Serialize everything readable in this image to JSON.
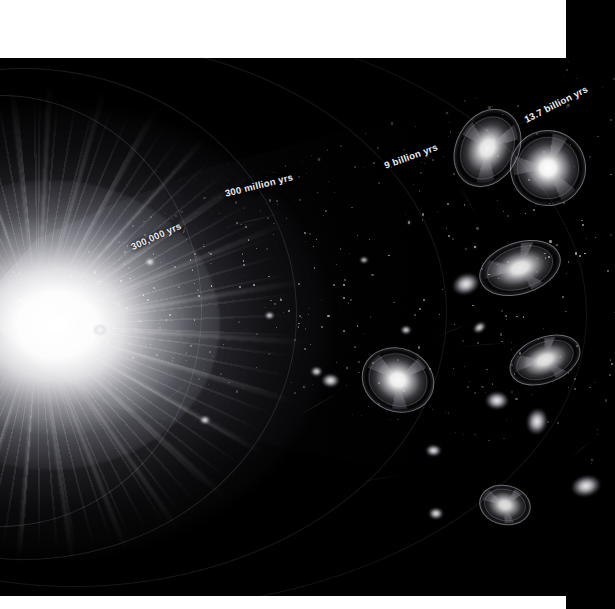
{
  "figure": {
    "background_color": "#000000",
    "letterbox_color": "#ffffff",
    "label_color": "#ededf2",
    "arc_color": "#afafbe"
  },
  "epoch_labels": [
    {
      "id": "epoch-300000-yrs",
      "text": "300,000 yrs",
      "x": 156,
      "y": 236,
      "rotation": -24
    },
    {
      "id": "epoch-300-million-yrs",
      "text": "300 million yrs",
      "x": 259,
      "y": 185,
      "rotation": -14
    },
    {
      "id": "epoch-9-billion-yrs",
      "text": "9 billion yrs",
      "x": 411,
      "y": 156,
      "rotation": -20
    },
    {
      "id": "epoch-13-7-billion-yrs",
      "text": "13.7 billion yrs",
      "x": 556,
      "y": 104,
      "rotation": -27
    }
  ],
  "epoch_arcs": [
    {
      "id": "arc-300000-yrs",
      "left": -200,
      "top": 95,
      "width": 400,
      "height": 430,
      "border_width": 1.1,
      "opacity": 0.46
    },
    {
      "id": "arc-300-million-yrs",
      "left": -250,
      "top": 68,
      "width": 545,
      "height": 490,
      "border_width": 1.0,
      "opacity": 0.4
    },
    {
      "id": "arc-9-billion-yrs",
      "left": -300,
      "top": 40,
      "width": 745,
      "height": 545,
      "border_width": 0.9,
      "opacity": 0.32
    },
    {
      "id": "arc-13-7-billion-yrs",
      "left": -340,
      "top": 18,
      "width": 925,
      "height": 590,
      "border_width": 0.9,
      "opacity": 0.28
    }
  ],
  "spiral_galaxies": [
    {
      "id": "galaxy-upper-left-oval",
      "x": 487,
      "y": 148,
      "w": 53,
      "h": 68,
      "rot": 28,
      "core": 0.95
    },
    {
      "id": "galaxy-upper-right-face",
      "x": 548,
      "y": 168,
      "w": 64,
      "h": 64,
      "rot": -12,
      "core": 1.0
    },
    {
      "id": "galaxy-mid-right-tilted",
      "x": 520,
      "y": 268,
      "w": 70,
      "h": 44,
      "rot": -18,
      "core": 0.92
    },
    {
      "id": "galaxy-lower-left-spiral",
      "x": 398,
      "y": 380,
      "w": 62,
      "h": 54,
      "rot": 22,
      "core": 0.98
    },
    {
      "id": "galaxy-lower-right-edge",
      "x": 545,
      "y": 360,
      "w": 62,
      "h": 38,
      "rot": -22,
      "core": 0.9
    },
    {
      "id": "galaxy-bottom-oval",
      "x": 505,
      "y": 505,
      "w": 44,
      "h": 34,
      "rot": 12,
      "core": 0.88
    }
  ],
  "blob_galaxies": [
    {
      "id": "blob-a",
      "x": 466,
      "y": 284,
      "w": 26,
      "h": 20,
      "rot": -20
    },
    {
      "id": "blob-b",
      "x": 497,
      "y": 400,
      "w": 22,
      "h": 17,
      "rot": 0
    },
    {
      "id": "blob-c",
      "x": 537,
      "y": 421,
      "w": 20,
      "h": 25,
      "rot": 10
    },
    {
      "id": "blob-d",
      "x": 586,
      "y": 486,
      "w": 28,
      "h": 20,
      "rot": -12
    },
    {
      "id": "blob-e",
      "x": 433,
      "y": 450,
      "w": 15,
      "h": 11,
      "rot": 0
    },
    {
      "id": "blob-f",
      "x": 479,
      "y": 327,
      "w": 13,
      "h": 9,
      "rot": -35
    },
    {
      "id": "blob-g",
      "x": 330,
      "y": 380,
      "w": 17,
      "h": 13,
      "rot": 0
    },
    {
      "id": "blob-h",
      "x": 316,
      "y": 371,
      "w": 11,
      "h": 9,
      "rot": 0
    },
    {
      "id": "blob-i",
      "x": 436,
      "y": 513,
      "w": 14,
      "h": 11,
      "rot": 0
    },
    {
      "id": "blob-j",
      "x": 406,
      "y": 330,
      "w": 10,
      "h": 8,
      "rot": 0
    },
    {
      "id": "blob-k",
      "x": 269,
      "y": 315,
      "w": 9,
      "h": 7,
      "rot": 0
    },
    {
      "id": "blob-l",
      "x": 364,
      "y": 260,
      "w": 8,
      "h": 6,
      "rot": 0
    },
    {
      "id": "blob-m",
      "x": 100,
      "y": 330,
      "w": 12,
      "h": 10,
      "rot": 0
    },
    {
      "id": "blob-n",
      "x": 150,
      "y": 262,
      "w": 10,
      "h": 8,
      "rot": 0
    },
    {
      "id": "blob-o",
      "x": 205,
      "y": 420,
      "w": 10,
      "h": 8,
      "rot": 0
    }
  ]
}
